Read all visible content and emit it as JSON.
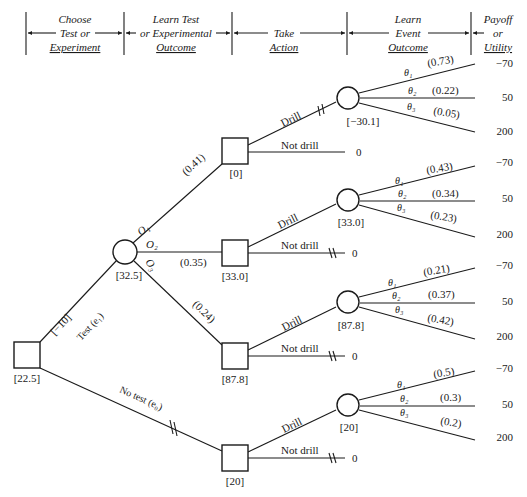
{
  "header": {
    "columns": [
      {
        "lines": [
          "Choose",
          "Test or",
          "Experiment"
        ]
      },
      {
        "lines": [
          "Learn Test",
          "or Experimental",
          "Outcome"
        ]
      },
      {
        "lines": [
          "",
          "Take",
          "Action"
        ]
      },
      {
        "lines": [
          "Learn",
          "Event",
          "Outcome"
        ]
      },
      {
        "lines": [
          "Payoff",
          "or",
          "Utility"
        ]
      }
    ]
  },
  "root": {
    "value": "[22.5]",
    "test_branch": {
      "label": "Test  (e₁)",
      "cost": "[−10]"
    },
    "no_test_branch": {
      "label": "No test   (e₀)"
    }
  },
  "test_outcome_node": {
    "value": "[32.5]",
    "outcomes": [
      {
        "label": "O₁",
        "prob": "(0.41)"
      },
      {
        "label": "O₂",
        "prob": "(0.35)"
      },
      {
        "label": "O₃",
        "prob": "(0.24)"
      }
    ]
  },
  "decision_nodes": [
    {
      "value": "[0]",
      "drill": "Drill",
      "not_drill": "Not drill",
      "not_drill_payoff": "0"
    },
    {
      "value": "[33.0]",
      "drill": "Drill",
      "not_drill": "Not drill",
      "not_drill_payoff": "0"
    },
    {
      "value": "[87.8]",
      "drill": "Drill",
      "not_drill": "Not drill",
      "not_drill_payoff": "0"
    },
    {
      "value": "[20]",
      "drill": "Drill",
      "not_drill": "Not drill",
      "not_drill_payoff": "0"
    }
  ],
  "event_nodes": [
    {
      "value": "[−30.1]",
      "events": [
        {
          "label": "θ₁",
          "prob": "(0.73)",
          "payoff": "−70"
        },
        {
          "label": "θ₂",
          "prob": "(0.22)",
          "payoff": "50"
        },
        {
          "label": "θ₃",
          "prob": "(0.05)",
          "payoff": "200"
        }
      ]
    },
    {
      "value": "[33.0]",
      "events": [
        {
          "label": "θ₁",
          "prob": "(0.43)",
          "payoff": "−70"
        },
        {
          "label": "θ₂",
          "prob": "(0.34)",
          "payoff": "50"
        },
        {
          "label": "θ₃",
          "prob": "(0.23)",
          "payoff": "200"
        }
      ]
    },
    {
      "value": "[87.8]",
      "events": [
        {
          "label": "θ₁",
          "prob": "(0.21)",
          "payoff": "−70"
        },
        {
          "label": "θ₂",
          "prob": "(0.37)",
          "payoff": "50"
        },
        {
          "label": "θ₃",
          "prob": "(0.42)",
          "payoff": "200"
        }
      ]
    },
    {
      "value": "[20]",
      "events": [
        {
          "label": "θ₁",
          "prob": "(0.5)",
          "payoff": "−70"
        },
        {
          "label": "θ₂",
          "prob": "(0.3)",
          "payoff": "50"
        },
        {
          "label": "θ₃",
          "prob": "(0.2)",
          "payoff": "200"
        }
      ]
    }
  ]
}
